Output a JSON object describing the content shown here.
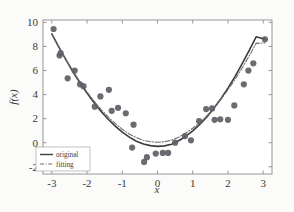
{
  "chart_data": {
    "type": "scatter",
    "title": "",
    "xlabel": "x",
    "ylabel": "f(x)",
    "xlim": [
      -3.25,
      3.25
    ],
    "ylim": [
      -2.6,
      10.2
    ],
    "xticks": [
      -3,
      -2,
      -1,
      0,
      1,
      2,
      3
    ],
    "xtick_labels": [
      "-3",
      "-2",
      "-1",
      "0",
      "1",
      "2",
      "3"
    ],
    "yticks": [
      -2,
      0,
      2,
      4,
      6,
      8,
      10
    ],
    "ytick_labels": [
      "-2",
      "0",
      "2",
      "4",
      "6",
      "8",
      "10"
    ],
    "grid": false,
    "legend_position": "lower left",
    "legend": [
      {
        "name": "original",
        "style": "solid",
        "color": "#3f3f3f"
      },
      {
        "name": "fitting",
        "style": "dashdot",
        "color": "#7a7a7a"
      }
    ],
    "marker": {
      "shape": "circle",
      "color": "#5e5e66",
      "size": 3.1
    },
    "series": [
      {
        "name": "data points",
        "type": "scatter",
        "points": [
          [
            -2.95,
            9.45
          ],
          [
            -2.78,
            7.25
          ],
          [
            -2.75,
            7.45
          ],
          [
            -2.55,
            5.35
          ],
          [
            -2.35,
            6.0
          ],
          [
            -2.2,
            4.85
          ],
          [
            -2.1,
            4.7
          ],
          [
            -1.78,
            3.0
          ],
          [
            -1.62,
            3.85
          ],
          [
            -1.38,
            4.4
          ],
          [
            -1.3,
            2.65
          ],
          [
            -1.12,
            2.9
          ],
          [
            -0.9,
            2.45
          ],
          [
            -0.68,
            1.5
          ],
          [
            -0.72,
            -0.4
          ],
          [
            -0.38,
            -1.6
          ],
          [
            -0.3,
            -1.2
          ],
          [
            -0.05,
            -0.9
          ],
          [
            0.15,
            -0.85
          ],
          [
            0.3,
            -0.85
          ],
          [
            0.5,
            0.0
          ],
          [
            0.78,
            0.55
          ],
          [
            0.95,
            0.2
          ],
          [
            1.18,
            1.8
          ],
          [
            1.38,
            2.8
          ],
          [
            1.55,
            2.85
          ],
          [
            1.62,
            1.9
          ],
          [
            1.78,
            1.95
          ],
          [
            2.0,
            1.9
          ],
          [
            2.18,
            3.1
          ],
          [
            2.45,
            4.85
          ],
          [
            2.58,
            6.0
          ],
          [
            2.72,
            6.6
          ],
          [
            3.05,
            8.6
          ]
        ]
      },
      {
        "name": "original",
        "type": "line",
        "style": "solid",
        "points": [
          [
            -3.0,
            9.05
          ],
          [
            -2.8,
            7.95
          ],
          [
            -2.6,
            6.9
          ],
          [
            -2.4,
            5.9
          ],
          [
            -2.2,
            4.98
          ],
          [
            -2.0,
            4.12
          ],
          [
            -1.8,
            3.32
          ],
          [
            -1.6,
            2.6
          ],
          [
            -1.4,
            1.95
          ],
          [
            -1.2,
            1.38
          ],
          [
            -1.0,
            0.88
          ],
          [
            -0.8,
            0.46
          ],
          [
            -0.6,
            0.12
          ],
          [
            -0.4,
            -0.1
          ],
          [
            -0.2,
            -0.24
          ],
          [
            0.0,
            -0.3
          ],
          [
            0.2,
            -0.26
          ],
          [
            0.4,
            -0.12
          ],
          [
            0.6,
            0.16
          ],
          [
            0.8,
            0.52
          ],
          [
            1.0,
            0.98
          ],
          [
            1.2,
            1.52
          ],
          [
            1.4,
            2.14
          ],
          [
            1.6,
            2.86
          ],
          [
            1.8,
            3.66
          ],
          [
            2.0,
            4.54
          ],
          [
            2.2,
            5.5
          ],
          [
            2.4,
            6.55
          ],
          [
            2.6,
            7.65
          ],
          [
            2.8,
            8.8
          ],
          [
            3.05,
            8.6
          ]
        ]
      },
      {
        "name": "fitting",
        "type": "line",
        "style": "dashdot",
        "points": [
          [
            -3.0,
            9.0
          ],
          [
            -2.8,
            7.92
          ],
          [
            -2.6,
            6.9
          ],
          [
            -2.4,
            5.95
          ],
          [
            -2.2,
            5.05
          ],
          [
            -2.0,
            4.22
          ],
          [
            -1.8,
            3.45
          ],
          [
            -1.6,
            2.76
          ],
          [
            -1.4,
            2.14
          ],
          [
            -1.2,
            1.6
          ],
          [
            -1.0,
            1.12
          ],
          [
            -0.8,
            0.72
          ],
          [
            -0.6,
            0.42
          ],
          [
            -0.4,
            0.2
          ],
          [
            -0.2,
            0.08
          ],
          [
            0.0,
            0.04
          ],
          [
            0.2,
            0.08
          ],
          [
            0.4,
            0.22
          ],
          [
            0.6,
            0.46
          ],
          [
            0.8,
            0.8
          ],
          [
            1.0,
            1.2
          ],
          [
            1.2,
            1.68
          ],
          [
            1.4,
            2.24
          ],
          [
            1.6,
            2.88
          ],
          [
            1.8,
            3.6
          ],
          [
            2.0,
            4.4
          ],
          [
            2.2,
            5.26
          ],
          [
            2.4,
            6.2
          ],
          [
            2.6,
            7.2
          ],
          [
            2.8,
            8.26
          ],
          [
            3.05,
            8.3
          ]
        ]
      }
    ]
  },
  "axes": {
    "frame_color": "#8c8c8c",
    "tick_color": "#8c8c8c",
    "background": "#ffffff"
  }
}
